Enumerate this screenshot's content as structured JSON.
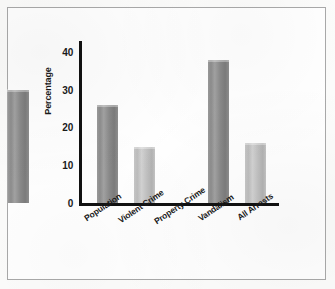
{
  "chart_data": {
    "type": "bar",
    "title": "",
    "xlabel": "",
    "ylabel": "Percentage",
    "categories": [
      "Population",
      "Violent Crime",
      "Property Crime",
      "Vandalism",
      "All Arrests"
    ],
    "values": [
      26,
      15,
      30,
      38,
      16
    ],
    "yticks": [
      "0",
      "10",
      "20",
      "30",
      "40"
    ],
    "ytick_values": [
      0,
      10,
      20,
      30,
      40
    ],
    "ylim": [
      0,
      44
    ],
    "grid": false,
    "legend": false,
    "bar_colors": [
      "#8d8d8d",
      "#c0c0c0",
      "#8d8d8d",
      "#8d8d8d",
      "#c0c0c0"
    ],
    "axis_color": "#111111",
    "frame_color": "#a9a9a9",
    "background": "#ffffff"
  },
  "axis": {
    "y_title": "Percentage"
  }
}
